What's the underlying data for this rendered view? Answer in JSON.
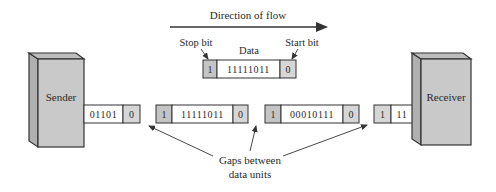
{
  "diagram": {
    "flow_label": "Direction of flow",
    "sender": {
      "label": "Sender"
    },
    "receiver": {
      "label": "Receiver"
    },
    "example_frame": {
      "stop_bit_label": "Stop bit",
      "data_label": "Data",
      "start_bit_label": "Start bit",
      "stop": "1",
      "data": "11111011",
      "start": "0"
    },
    "stream": [
      {
        "data": "01101",
        "start": "0"
      },
      {
        "stop": "1",
        "data": "11111011",
        "start": "0"
      },
      {
        "stop": "1",
        "data": "00010111",
        "start": "0"
      },
      {
        "stop": "1",
        "data": "11"
      }
    ],
    "gaps_label_line1": "Gaps between",
    "gaps_label_line2": "data units"
  },
  "colors": {
    "box_fill": "#c8c8c8",
    "box_side": "#b4b4b4",
    "bit_fill": "#cfcfcf",
    "stroke": "#333333"
  }
}
